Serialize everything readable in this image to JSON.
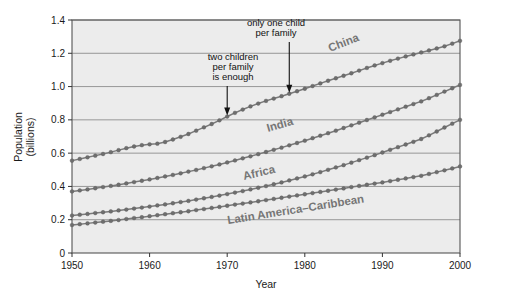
{
  "chart_data": {
    "type": "line",
    "title": "",
    "xlabel": "Year",
    "ylabel": "Population (billions)",
    "ylabel_line1": "Population",
    "ylabel_line2": "(billions)",
    "xlim": [
      1950,
      2000
    ],
    "ylim": [
      0,
      1.4
    ],
    "xticks": [
      1950,
      1960,
      1970,
      1980,
      1990,
      2000
    ],
    "xtick_labels": [
      "1950",
      "1960",
      "1970",
      "1980",
      "1990",
      "2000"
    ],
    "yticks": [
      0,
      0.2,
      0.4,
      0.6,
      0.8,
      1.0,
      1.2,
      1.4
    ],
    "ytick_labels": [
      "0",
      "0.2",
      "0.4",
      "0.6",
      "0.8",
      "1.0",
      "1.2",
      "1.4"
    ],
    "grid": "horizontal",
    "legend": "inline-labels",
    "marker": "circle",
    "line_color": "#7a7a7a",
    "marker_color": "#6e6e6e",
    "plot_background": "#ececec",
    "x": [
      1950,
      1951,
      1952,
      1953,
      1954,
      1955,
      1956,
      1957,
      1958,
      1959,
      1960,
      1961,
      1962,
      1963,
      1964,
      1965,
      1966,
      1967,
      1968,
      1969,
      1970,
      1971,
      1972,
      1973,
      1974,
      1975,
      1976,
      1977,
      1978,
      1979,
      1980,
      1981,
      1982,
      1983,
      1984,
      1985,
      1986,
      1987,
      1988,
      1989,
      1990,
      1991,
      1992,
      1993,
      1994,
      1995,
      1996,
      1997,
      1998,
      1999,
      2000
    ],
    "series": [
      {
        "name": "China",
        "label": "China",
        "values": [
          0.555,
          0.565,
          0.575,
          0.585,
          0.595,
          0.606,
          0.618,
          0.63,
          0.64,
          0.648,
          0.653,
          0.657,
          0.667,
          0.682,
          0.698,
          0.715,
          0.735,
          0.755,
          0.775,
          0.797,
          0.82,
          0.842,
          0.862,
          0.881,
          0.898,
          0.914,
          0.928,
          0.942,
          0.957,
          0.972,
          0.987,
          1.003,
          1.019,
          1.035,
          1.05,
          1.065,
          1.08,
          1.096,
          1.112,
          1.127,
          1.141,
          1.155,
          1.168,
          1.181,
          1.193,
          1.205,
          1.217,
          1.229,
          1.242,
          1.258,
          1.275
        ]
      },
      {
        "name": "India",
        "label": "India",
        "values": [
          0.37,
          0.376,
          0.382,
          0.389,
          0.396,
          0.403,
          0.41,
          0.418,
          0.426,
          0.434,
          0.442,
          0.451,
          0.46,
          0.469,
          0.479,
          0.489,
          0.499,
          0.51,
          0.521,
          0.532,
          0.544,
          0.556,
          0.569,
          0.581,
          0.594,
          0.607,
          0.62,
          0.633,
          0.647,
          0.661,
          0.675,
          0.69,
          0.705,
          0.72,
          0.735,
          0.751,
          0.767,
          0.783,
          0.799,
          0.815,
          0.831,
          0.847,
          0.863,
          0.879,
          0.895,
          0.911,
          0.93,
          0.95,
          0.97,
          0.99,
          1.01
        ]
      },
      {
        "name": "Africa",
        "label": "Africa",
        "values": [
          0.225,
          0.23,
          0.235,
          0.24,
          0.245,
          0.25,
          0.256,
          0.261,
          0.267,
          0.273,
          0.279,
          0.286,
          0.292,
          0.299,
          0.306,
          0.313,
          0.321,
          0.329,
          0.337,
          0.345,
          0.354,
          0.363,
          0.372,
          0.382,
          0.392,
          0.402,
          0.413,
          0.424,
          0.436,
          0.448,
          0.46,
          0.473,
          0.486,
          0.5,
          0.514,
          0.528,
          0.543,
          0.558,
          0.573,
          0.588,
          0.604,
          0.62,
          0.636,
          0.652,
          0.668,
          0.685,
          0.707,
          0.73,
          0.754,
          0.777,
          0.8
        ]
      },
      {
        "name": "Latin America–Caribbean",
        "label": "Latin America–Caribbean",
        "values": [
          0.168,
          0.173,
          0.178,
          0.183,
          0.188,
          0.193,
          0.198,
          0.204,
          0.21,
          0.215,
          0.221,
          0.227,
          0.233,
          0.239,
          0.245,
          0.251,
          0.258,
          0.264,
          0.271,
          0.277,
          0.284,
          0.291,
          0.297,
          0.304,
          0.311,
          0.318,
          0.325,
          0.332,
          0.339,
          0.346,
          0.353,
          0.36,
          0.367,
          0.374,
          0.381,
          0.388,
          0.396,
          0.403,
          0.41,
          0.417,
          0.424,
          0.432,
          0.44,
          0.448,
          0.456,
          0.464,
          0.475,
          0.486,
          0.497,
          0.508,
          0.52
        ]
      }
    ],
    "annotations": [
      {
        "id": "two-children",
        "lines": [
          "two children",
          "per family",
          "is enough"
        ],
        "text": "two children per family is enough",
        "point_year": 1970,
        "point_value": 0.82
      },
      {
        "id": "one-child",
        "lines": [
          "only one child",
          "per family"
        ],
        "text": "only one child per family",
        "point_year": 1978,
        "point_value": 0.957
      }
    ]
  }
}
